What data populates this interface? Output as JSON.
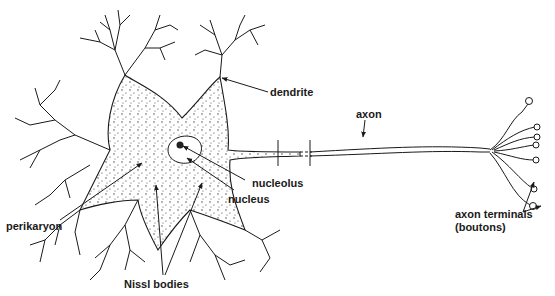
{
  "diagram": {
    "colors": {
      "line": "#1a1a1a",
      "background": "#ffffff"
    },
    "labels": {
      "dendrite": "dendrite",
      "axon": "axon",
      "nucleolus": "nucleolus",
      "nucleus": "nucleus",
      "perikaryon": "perikaryon",
      "nissl_bodies": "Nissl bodies",
      "axon_terminals_line1": "axon terminals",
      "axon_terminals_line2": "(boutons)"
    }
  }
}
